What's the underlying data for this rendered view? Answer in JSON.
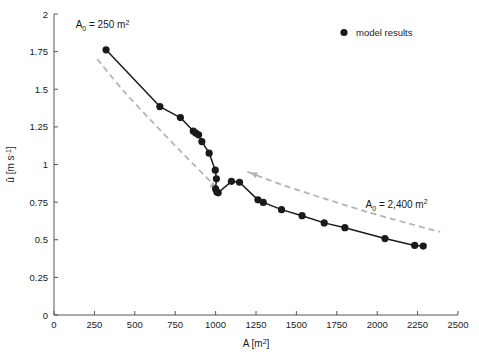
{
  "chart_data": {
    "type": "line",
    "title": "",
    "xlabel_text": "A",
    "xlabel_unit": "[m",
    "xlabel_unit_sup": "2",
    "xlabel_unit_end": "]",
    "ylabel_text": "û",
    "ylabel_unit": "[m s",
    "ylabel_unit_sup": "-1",
    "ylabel_unit_end": "]",
    "xlim": [
      0,
      2500
    ],
    "ylim": [
      0,
      2
    ],
    "xticks": [
      0,
      250,
      500,
      750,
      1000,
      1250,
      1500,
      1750,
      2000,
      2250,
      2500
    ],
    "xtick_labels": [
      "0",
      "250",
      "500",
      "750",
      "1000",
      "1250",
      "1500",
      "1750",
      "2000",
      "2250",
      "2500"
    ],
    "yticks": [
      0,
      0.25,
      0.5,
      0.75,
      1,
      1.25,
      1.5,
      1.75,
      2
    ],
    "ytick_labels": [
      "0",
      "0.25",
      "0.5",
      "0.75",
      "1",
      "1.25",
      "1.5",
      "1.75",
      "2"
    ],
    "grid": false,
    "legend_position": "top-right",
    "series": [
      {
        "name": "model results",
        "marker": "filled-circle",
        "color": "#1a1a1a",
        "points": [
          [
            322,
            1.762
          ],
          [
            655,
            1.385
          ],
          [
            782,
            1.312
          ],
          [
            862,
            1.222
          ],
          [
            878,
            1.208
          ],
          [
            895,
            1.197
          ],
          [
            915,
            1.152
          ],
          [
            960,
            1.075
          ],
          [
            998,
            0.962
          ],
          [
            1005,
            0.905
          ],
          [
            1000,
            0.838
          ],
          [
            1008,
            0.818
          ],
          [
            1016,
            0.812
          ],
          [
            1098,
            0.888
          ],
          [
            1148,
            0.882
          ],
          [
            1262,
            0.765
          ],
          [
            1295,
            0.748
          ],
          [
            1408,
            0.7
          ],
          [
            1535,
            0.66
          ],
          [
            1672,
            0.612
          ],
          [
            1800,
            0.58
          ],
          [
            2048,
            0.508
          ],
          [
            2232,
            0.462
          ],
          [
            2285,
            0.458
          ]
        ]
      }
    ],
    "reference_curves": [
      {
        "name": "decreasing-branch-guide",
        "style": "dashed",
        "color": "#b4b4b4",
        "points": [
          [
            268,
            1.7
          ],
          [
            430,
            1.49
          ],
          [
            620,
            1.27
          ],
          [
            800,
            1.07
          ],
          [
            940,
            0.918
          ],
          [
            1022,
            0.832
          ]
        ],
        "arrow_at": [
          1010,
          0.845
        ],
        "arrow_direction": "down-right"
      },
      {
        "name": "recovery-branch-guide",
        "style": "dashed",
        "color": "#b4b4b4",
        "points": [
          [
            1196,
            0.952
          ],
          [
            1420,
            0.862
          ],
          [
            1700,
            0.765
          ],
          [
            1980,
            0.672
          ],
          [
            2230,
            0.598
          ],
          [
            2390,
            0.552
          ]
        ],
        "arrow_at": [
          1215,
          0.948
        ],
        "arrow_direction": "up-left"
      }
    ],
    "annotations": [
      {
        "name": "a0-low-annotation",
        "text_a": "A",
        "text_sub": "0",
        "text_rest": " = 250 m",
        "text_sup": "2",
        "x": 300,
        "y": 1.905
      },
      {
        "name": "a0-high-annotation",
        "text_a": "A",
        "text_sub": "0",
        "text_rest": " = 2,400 m",
        "text_sup": "2",
        "x": 2120,
        "y": 0.712
      }
    ],
    "legend": {
      "entries": [
        {
          "label": "model results",
          "marker": "filled-circle",
          "color": "#1a1a1a"
        }
      ]
    }
  }
}
